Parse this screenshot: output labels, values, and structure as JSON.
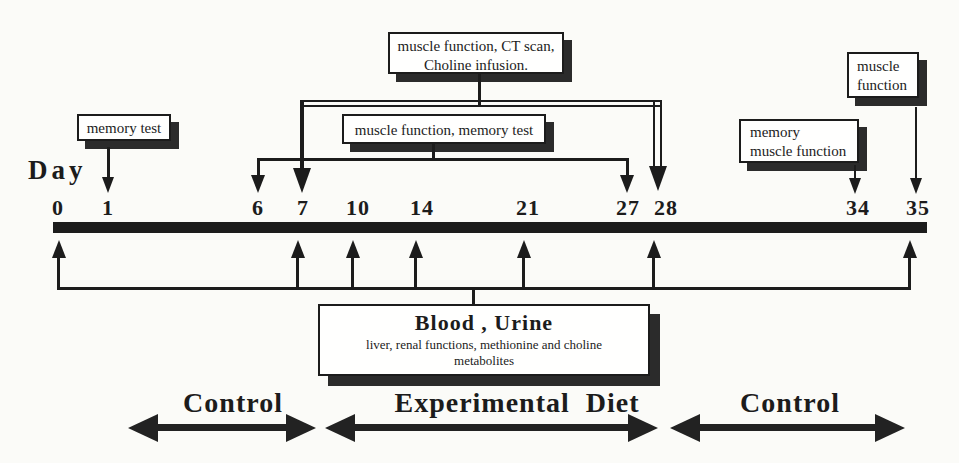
{
  "axis": {
    "label": "Day"
  },
  "timeline": {
    "ticks": [
      {
        "label": "0"
      },
      {
        "label": "1"
      },
      {
        "label": "6"
      },
      {
        "label": "7"
      },
      {
        "label": "10"
      },
      {
        "label": "14"
      },
      {
        "label": "21"
      },
      {
        "label": "27"
      },
      {
        "label": "28"
      },
      {
        "label": "34"
      },
      {
        "label": "35"
      }
    ]
  },
  "annotations": {
    "memory_test": {
      "text": "memory test",
      "days": [
        1
      ]
    },
    "ct_scan": {
      "line1": "muscle function, CT scan,",
      "line2": "Choline infusion.",
      "days": [
        7,
        28
      ]
    },
    "muscle_memory": {
      "text": "muscle function,  memory test",
      "days": [
        6,
        27
      ]
    },
    "memory_muscle": {
      "line1": "memory",
      "line2": "muscle function",
      "days": [
        34
      ]
    },
    "muscle_function": {
      "line1": "muscle",
      "line2": "function",
      "days": [
        35
      ]
    },
    "blood_urine": {
      "title": "Blood , Urine",
      "line1": "liver, renal functions, methionine and choline",
      "line2": "metabolites",
      "days": [
        0,
        7,
        10,
        14,
        21,
        28,
        35
      ]
    }
  },
  "phases": [
    {
      "label": "Control"
    },
    {
      "label": "Experimental  Diet"
    },
    {
      "label": "Control"
    }
  ],
  "colors": {
    "ink": "#1c1c1c",
    "shadow": "#2b2b2b",
    "background": "#fbfbf8"
  }
}
